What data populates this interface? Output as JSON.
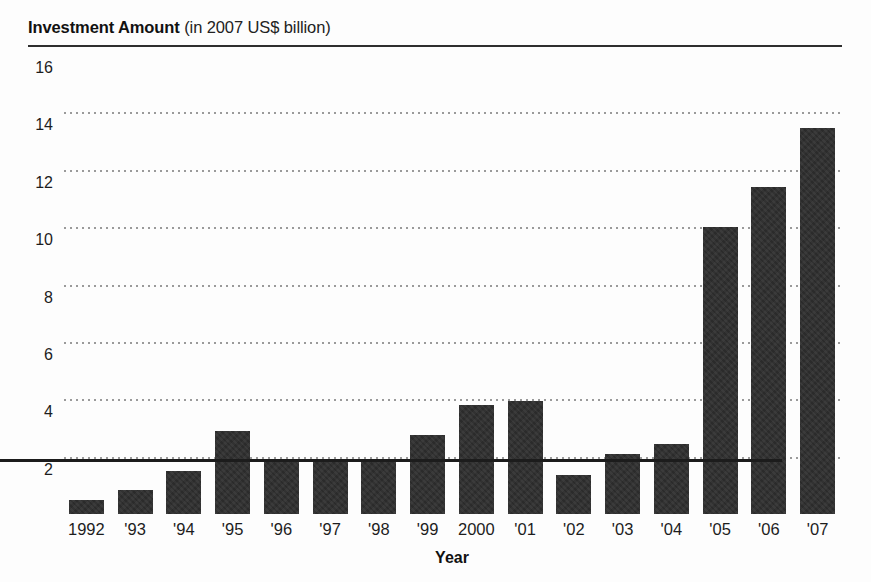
{
  "chart_data": {
    "type": "bar",
    "title": "Investment Amount (in 2007 US$ billion)",
    "title_bold_part": "Investment Amount",
    "title_rest": " (in 2007 US$ billion)",
    "xlabel": "Year",
    "ylabel": "",
    "ylim": [
      0,
      16
    ],
    "ytick_values": [
      2,
      4,
      6,
      8,
      10,
      12,
      14,
      16
    ],
    "ytick_labels": [
      "2",
      "4",
      "6",
      "8",
      "10",
      "12",
      "14",
      "16"
    ],
    "grid": "dotted-horizontal",
    "legend": "none",
    "bar_color": "#2b2b2b",
    "categories": [
      "1992",
      "'93",
      "'94",
      "'95",
      "'96",
      "'97",
      "'98",
      "'99",
      "2000",
      "'01",
      "'02",
      "'03",
      "'04",
      "'05",
      "'06",
      "'07"
    ],
    "values": [
      0.5,
      0.85,
      1.5,
      2.9,
      1.9,
      1.85,
      1.9,
      2.75,
      3.8,
      3.95,
      1.35,
      2.1,
      2.45,
      10.0,
      11.4,
      13.45
    ],
    "bars": [
      {
        "label": "1992",
        "value": 0.5
      },
      {
        "label": "'93",
        "value": 0.85
      },
      {
        "label": "'94",
        "value": 1.5
      },
      {
        "label": "'95",
        "value": 2.9
      },
      {
        "label": "'96",
        "value": 1.9
      },
      {
        "label": "'97",
        "value": 1.85
      },
      {
        "label": "'98",
        "value": 1.9
      },
      {
        "label": "'99",
        "value": 2.75
      },
      {
        "label": "2000",
        "value": 3.8
      },
      {
        "label": "'01",
        "value": 3.95
      },
      {
        "label": "'02",
        "value": 1.35
      },
      {
        "label": "'03",
        "value": 2.1
      },
      {
        "label": "'04",
        "value": 2.45
      },
      {
        "label": "'05",
        "value": 10.0
      },
      {
        "label": "'06",
        "value": 11.4
      },
      {
        "label": "'07",
        "value": 13.45
      }
    ]
  }
}
